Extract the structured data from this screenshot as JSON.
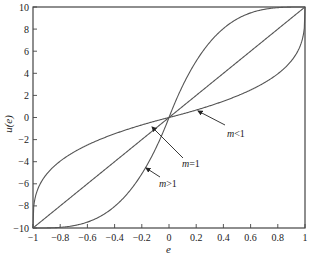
{
  "chart_data": {
    "type": "line",
    "title": "",
    "xlabel": "e",
    "ylabel": "u(e)",
    "xlim": [
      -1,
      1
    ],
    "ylim": [
      -10,
      10
    ],
    "grid": false,
    "legend": "none (inline annotations)",
    "x_ticks": [
      -1,
      -0.8,
      -0.6,
      -0.4,
      -0.2,
      0,
      0.2,
      0.4,
      0.6,
      0.8,
      1
    ],
    "x_tick_labels": [
      "−1",
      "−0.8",
      "−0.6",
      "−0.4",
      "−0.2",
      "0",
      "0.2",
      "0.4",
      "0.6",
      "0.8",
      "1"
    ],
    "y_ticks": [
      -10,
      -8,
      -6,
      -4,
      -2,
      0,
      2,
      4,
      6,
      8,
      10
    ],
    "y_tick_labels": [
      "−10",
      "−8",
      "−6",
      "−4",
      "−2",
      "0",
      "2",
      "4",
      "6",
      "8",
      "10"
    ],
    "x": [
      -1,
      -0.9,
      -0.8,
      -0.7,
      -0.6,
      -0.5,
      -0.4,
      -0.3,
      -0.2,
      -0.1,
      0,
      0.1,
      0.2,
      0.3,
      0.4,
      0.5,
      0.6,
      0.7,
      0.8,
      0.9,
      1
    ],
    "series": [
      {
        "name": "m<1",
        "values": [
          -10,
          -5.4,
          -4.2,
          -3.3,
          -2.6,
          -2.1,
          -1.6,
          -1.1,
          -0.7,
          -0.35,
          0,
          0.35,
          0.7,
          1.1,
          1.6,
          2.1,
          2.6,
          3.3,
          4.2,
          5.4,
          10
        ]
      },
      {
        "name": "m=1",
        "values": [
          -10,
          -9,
          -8,
          -7,
          -6,
          -5,
          -4,
          -3,
          -2,
          -1,
          0,
          1,
          2,
          3,
          4,
          5,
          6,
          7,
          8,
          9,
          10
        ]
      },
      {
        "name": "m>1",
        "values": [
          -10,
          -9.99,
          -9.9,
          -9.7,
          -9.4,
          -8.8,
          -7.8,
          -6.6,
          -4.9,
          -2.7,
          0,
          2.7,
          4.9,
          6.6,
          7.8,
          8.8,
          9.4,
          9.7,
          9.9,
          9.99,
          10
        ]
      }
    ],
    "annotations": [
      {
        "text": "m<1",
        "points_to": "m<1 curve near e≈0.1"
      },
      {
        "text": "m=1",
        "points_to": "m=1 line near e≈-0.08"
      },
      {
        "text": "m>1",
        "points_to": "m>1 curve near e≈-0.15"
      }
    ]
  },
  "labels": {
    "xlabel": "e",
    "ylabel": "u(e)",
    "annot_m_lt_1_m": "m",
    "annot_m_lt_1_rel": "<1",
    "annot_m_eq_1_m": "m",
    "annot_m_eq_1_rel": "=1",
    "annot_m_gt_1_m": "m",
    "annot_m_gt_1_rel": ">1"
  }
}
